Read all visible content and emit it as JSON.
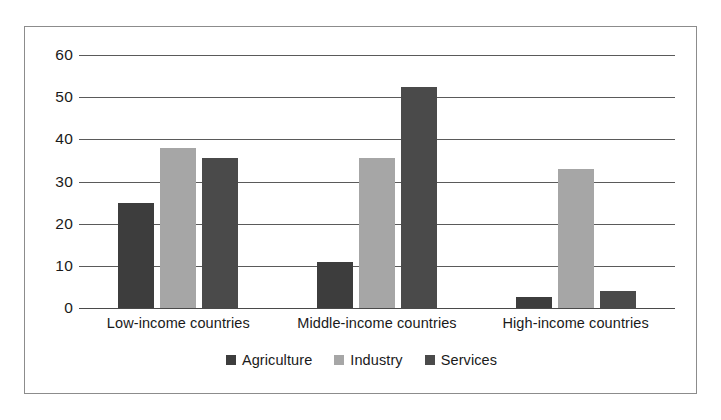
{
  "chart_data": {
    "type": "bar",
    "title": "",
    "subtitle": "",
    "xlabel": "",
    "ylabel": "",
    "categories": [
      "Low-income countries",
      "Middle-income countries",
      "High-income countries"
    ],
    "series": [
      {
        "name": "Agriculture",
        "color": "#3d3d3d",
        "values": [
          25,
          11,
          2.5
        ]
      },
      {
        "name": "Industry",
        "color": "#a6a6a6",
        "values": [
          38,
          35.5,
          33
        ]
      },
      {
        "name": "Services",
        "color": "#4a4a4a",
        "values": [
          35.5,
          52.5,
          4
        ]
      }
    ],
    "ylim": [
      0,
      60
    ],
    "yticks": [
      0,
      10,
      20,
      30,
      40,
      50,
      60
    ],
    "ytick_labels": [
      "0",
      "10",
      "20",
      "30",
      "40",
      "50",
      "60"
    ],
    "grid": true,
    "legend_position": "bottom",
    "legend_entries": [
      "Agriculture",
      "Industry",
      "Services"
    ]
  },
  "colors": {
    "agriculture": "#3d3d3d",
    "industry": "#a6a6a6",
    "services": "#4a4a4a",
    "gridline": "#5a5a5a",
    "frame": "#8c8c8c",
    "text": "#1a1a1a",
    "background": "#ffffff"
  }
}
